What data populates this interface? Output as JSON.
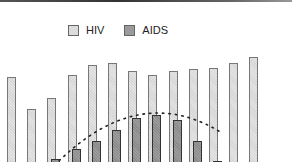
{
  "chart_data": {
    "type": "bar",
    "title": "",
    "xlabel": "",
    "ylabel": "",
    "legend": {
      "position": "top",
      "entries": [
        "HIV",
        "AIDS"
      ]
    },
    "grid": false,
    "categories": [
      "1",
      "2",
      "3",
      "4",
      "5",
      "6",
      "7",
      "8",
      "9",
      "10",
      "11",
      "12",
      "13"
    ],
    "series": [
      {
        "name": "HIV",
        "values": [
          85,
          53,
          64,
          87,
          97,
          99,
          91,
          87,
          91,
          93,
          94,
          99,
          105
        ]
      },
      {
        "name": "AIDS",
        "values": [
          0,
          0,
          3,
          13,
          21,
          32,
          44,
          47,
          42,
          21,
          1,
          0,
          0
        ]
      }
    ],
    "trendline": {
      "series": "AIDS",
      "style": "dotted",
      "shape": "parabolic rise then fall"
    },
    "note": "Values are relative heights in pixels above the visible bottom edge; axes are cropped out of view."
  },
  "legend": {
    "hiv_label": "HIV",
    "aids_label": "AIDS"
  },
  "colors": {
    "hiv_fill": "#dcdcdc",
    "aids_fill": "#9a9a9a",
    "border": "#555555"
  }
}
